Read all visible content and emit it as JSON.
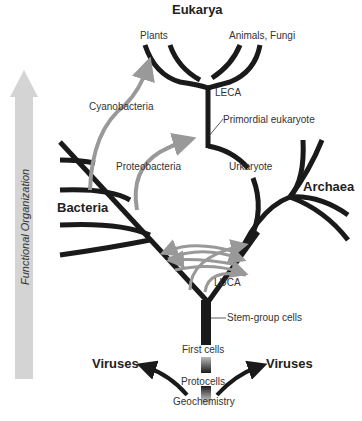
{
  "title": "Eukarya",
  "axis_label": "Functional Organization",
  "groups": {
    "eukarya": "Eukarya",
    "bacteria": "Bacteria",
    "archaea": "Archaea",
    "viruses_left": "Viruses",
    "viruses_right": "Viruses"
  },
  "labels": {
    "plants": "Plants",
    "animals_fungi": "Animals, Fungi",
    "leca": "LECA",
    "primordial_eukaryote": "Primordial eukaryote",
    "cyanobacteria": "Cyanobacteria",
    "proteobacteria": "Proteobacteria",
    "urkaryote": "Urkaryote",
    "luca": "LUCA",
    "stem_group_cells": "Stem-group cells",
    "first_cells": "First cells",
    "protocells": "Protocells",
    "geochemistry": "Geochemistry"
  },
  "colors": {
    "tree": "#1a1a1a",
    "transfer_arrows": "#999999",
    "axis_arrow": "#d4d4d4"
  }
}
